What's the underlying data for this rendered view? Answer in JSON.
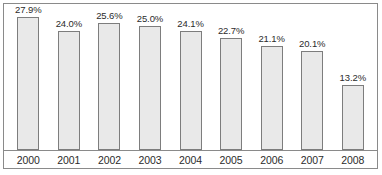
{
  "chart_data": {
    "type": "bar",
    "title": "",
    "subtitle": "",
    "xlabel": "",
    "ylabel": "",
    "categories": [
      "2000",
      "2001",
      "2002",
      "2003",
      "2004",
      "2005",
      "2006",
      "2007",
      "2008"
    ],
    "values": [
      27.9,
      24.0,
      25.6,
      25.0,
      24.1,
      22.7,
      21.1,
      20.1,
      13.2
    ],
    "data_labels": [
      "27.9%",
      "24.0%",
      "25.6%",
      "25.0%",
      "24.1%",
      "22.7%",
      "21.1%",
      "20.1%",
      "13.2%"
    ],
    "ylim": [
      0,
      29.5
    ],
    "grid": false,
    "legend": null,
    "legend_position": "none",
    "annotations": [],
    "axis_tick_labels_x": [
      "2000",
      "2001",
      "2002",
      "2003",
      "2004",
      "2005",
      "2006",
      "2007",
      "2008"
    ],
    "axis_tick_labels_y": [],
    "colors": {
      "bar_fill": "#e9e9e9",
      "bar_border": "#7d7d7d",
      "frame_border": "#8a8a8a",
      "axis_line": "#8a8a8a",
      "text": "#2b2b2b",
      "background": "#ffffff"
    }
  }
}
